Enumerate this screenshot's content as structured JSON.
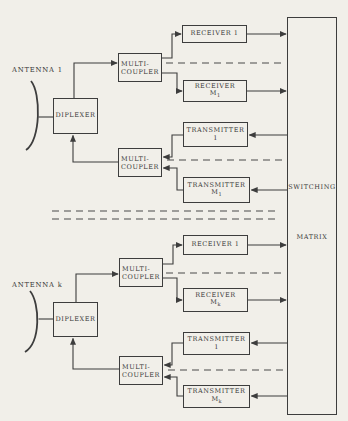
{
  "figure": {
    "background_color": "#f1efe9",
    "ink_color": "#3d3d3d"
  },
  "groups": [
    {
      "antenna": "ANTENNA 1",
      "diplexer": "DIPLEXER",
      "rx_multicoupler": {
        "line1": "MULTI-",
        "line2": "COUPLER"
      },
      "tx_multicoupler": {
        "line1": "MULTI-",
        "line2": "COUPLER"
      },
      "receiver_first": "RECEIVER 1",
      "receiver_last": {
        "word": "RECEIVER",
        "m": "M",
        "sub": "1"
      },
      "transmitter_first": {
        "word": "TRANSMITTER",
        "num": "1"
      },
      "transmitter_last": {
        "word": "TRANSMITTER",
        "m": "M",
        "sub": "1"
      }
    },
    {
      "antenna": "ANTENNA k",
      "diplexer": "DIPLEXER",
      "rx_multicoupler": {
        "line1": "MULTI-",
        "line2": "COUPLER"
      },
      "tx_multicoupler": {
        "line1": "MULTI-",
        "line2": "COUPLER"
      },
      "receiver_first": "RECEIVER 1",
      "receiver_last": {
        "word": "RECEIVER",
        "m": "M",
        "sub": "k"
      },
      "transmitter_first": {
        "word": "TRANSMITTER",
        "num": "1"
      },
      "transmitter_last": {
        "word": "TRANSMITTER",
        "m": "M",
        "sub": "k"
      }
    }
  ],
  "matrix": {
    "word1": "SWITCHING",
    "word2": "MATRIX"
  }
}
